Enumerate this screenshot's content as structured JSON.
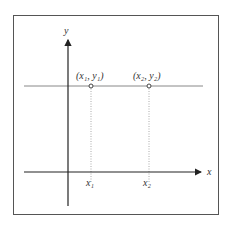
{
  "diagram": {
    "axes": {
      "x_label": "x",
      "y_label": "y"
    },
    "points": [
      {
        "label": "(x₁, y₁)",
        "tick_label": "x₁"
      },
      {
        "label": "(x₂, y₂)",
        "tick_label": "x₂"
      }
    ],
    "colors": {
      "frame": "#555555",
      "axis": "#222222",
      "horizontal_line": "#888888",
      "dotted": "#aaaaaa",
      "point": "#444444"
    }
  }
}
